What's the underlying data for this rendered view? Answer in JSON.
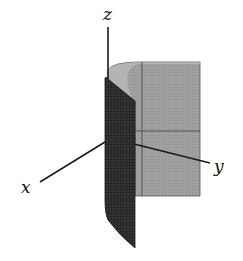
{
  "figure": {
    "type": "3d-surface-diagram",
    "axes": {
      "x": {
        "label": "x"
      },
      "y": {
        "label": "y"
      },
      "z": {
        "label": "z"
      }
    },
    "colors": {
      "background": "#ffffff",
      "axis": "#1a1a1a",
      "back_surface": "#9a9a9a",
      "front_surface": "#2b2b2b",
      "top_rim": "#c4c4c4",
      "grid_line": "#4a4a4a"
    }
  }
}
